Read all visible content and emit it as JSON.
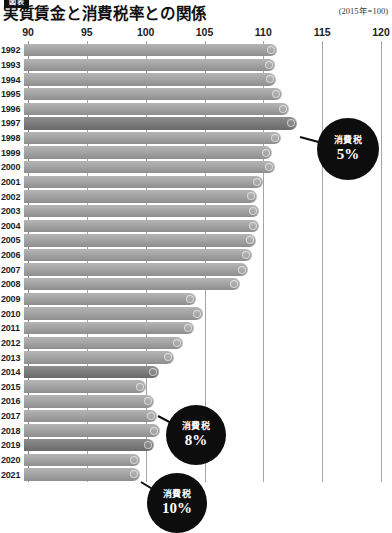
{
  "header": {
    "kicker": "図表",
    "title": "実質賃金と消費税率との関係",
    "unit_note": "(2015年=100)"
  },
  "chart_data": {
    "type": "bar",
    "orientation": "horizontal",
    "title": "実質賃金と消費税率との関係",
    "subtitle": "(2015年=100)",
    "xlabel": "",
    "ylabel": "",
    "xlim": [
      90,
      120
    ],
    "xticks": [
      90,
      95,
      100,
      105,
      110,
      115,
      120
    ],
    "xtick_labels": [
      "90",
      "95",
      "100",
      "105",
      "110",
      "115",
      "120"
    ],
    "grid": true,
    "legend": "none",
    "categories": [
      "1992",
      "1993",
      "1994",
      "1995",
      "1996",
      "1997",
      "1998",
      "1999",
      "2000",
      "2001",
      "2002",
      "2003",
      "2004",
      "2005",
      "2006",
      "2007",
      "2008",
      "2009",
      "2010",
      "2011",
      "2012",
      "2013",
      "2014",
      "2015",
      "2016",
      "2017",
      "2018",
      "2019",
      "2020",
      "2021"
    ],
    "values": [
      111.2,
      111.0,
      111.1,
      111.6,
      112.2,
      112.9,
      111.5,
      110.7,
      111.0,
      110.0,
      109.5,
      109.6,
      109.6,
      109.4,
      109.0,
      108.7,
      108.0,
      104.3,
      104.9,
      104.1,
      103.2,
      102.4,
      101.1,
      100.0,
      100.7,
      101.0,
      101.2,
      100.7,
      99.5,
      99.5
    ],
    "highlighted": [
      "1997",
      "2014",
      "2019"
    ],
    "bar_color": "#a3a3a3",
    "highlight_color": "#7b7b7b",
    "annotations": [
      {
        "id": "tax5",
        "label": "消費税",
        "value": "5%",
        "target_year": "1997"
      },
      {
        "id": "tax8",
        "label": "消費税",
        "value": "8%",
        "target_year": "2014"
      },
      {
        "id": "tax10",
        "label": "消費税",
        "value": "10%",
        "target_year": "2019"
      }
    ]
  }
}
